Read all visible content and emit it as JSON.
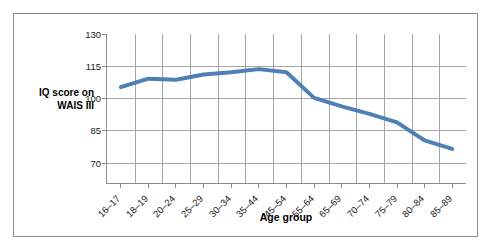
{
  "figure": {
    "frame_color": "#8c8c8c",
    "background": "#ffffff"
  },
  "axes": {
    "y_title_line1": "IQ score on",
    "y_title_line2": "WAIS III",
    "x_title": "Age group"
  },
  "chart_data": {
    "type": "line",
    "title": "",
    "xlabel": "Age group",
    "ylabel": "IQ score on WAIS III",
    "categories": [
      "16–17",
      "18–19",
      "20–24",
      "25–29",
      "30–34",
      "35–44",
      "45–54",
      "55–64",
      "65–69",
      "70–74",
      "75–79",
      "80–84",
      "85–89"
    ],
    "values": [
      105,
      109,
      108.5,
      111,
      112,
      113.5,
      112,
      100,
      96,
      92.5,
      88.5,
      80,
      76
    ],
    "series": [
      {
        "name": "IQ score on WAIS III",
        "color": "#4e7fb5",
        "values": [
          105,
          109,
          108.5,
          111,
          112,
          113.5,
          112,
          100,
          96,
          92.5,
          88.5,
          80,
          76
        ]
      }
    ],
    "ylim": [
      60,
      130
    ],
    "yticks": [
      130,
      115,
      100,
      85,
      70
    ],
    "ytick_labels": [
      "130",
      "115",
      "100",
      "85",
      "70"
    ],
    "grid": true,
    "grid_color": "#a6a6a6",
    "legend": false,
    "legend_position": "none",
    "line_width_px": 4
  }
}
